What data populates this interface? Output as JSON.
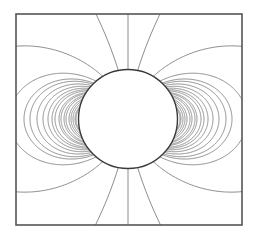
{
  "diagram": {
    "type": "dipole-field-lines",
    "frame": {
      "x": 16,
      "y": 14,
      "width": 226,
      "height": 211,
      "stroke": "#555555",
      "stroke_width": 1.6
    },
    "sphere": {
      "cx": 128,
      "cy": 119,
      "r": 49.5,
      "stroke": "#3a3a3a",
      "stroke_width": 1.4,
      "fill": "#ffffff"
    },
    "field_lines": {
      "stroke": "#808080",
      "stroke_width": 0.9,
      "equatorial_radii": [
        52,
        53,
        55,
        57,
        59,
        62,
        64,
        67,
        69,
        73,
        76,
        80,
        85,
        91,
        98,
        104,
        119,
        190,
        1290
      ],
      "axis_line": true
    }
  }
}
